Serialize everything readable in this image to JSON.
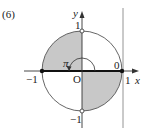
{
  "problem_number": "(6)",
  "axes": {
    "x_label": "x",
    "y_label": "y",
    "origin_label": "O"
  },
  "ticks": {
    "x_neg": "−1",
    "x_pos": "1",
    "y_pos": "1",
    "y_neg": "−1"
  },
  "annotations": {
    "angle_label": "π",
    "zero_label": "0"
  },
  "colors": {
    "shade": "#c8c8c8",
    "stroke": "#555555",
    "vertical_line": "#888888"
  },
  "shaded_regions": [
    "second quadrant",
    "fourth quadrant"
  ]
}
